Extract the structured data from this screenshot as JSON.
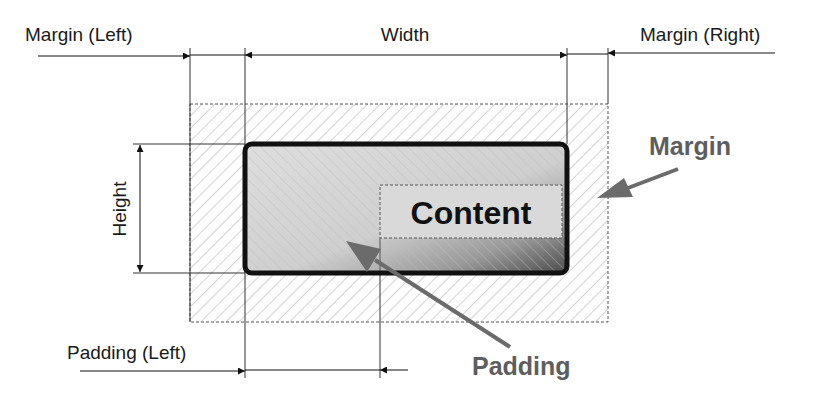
{
  "diagram": {
    "dimension_labels": {
      "margin_left": "Margin (Left)",
      "width": "Width",
      "margin_right": "Margin (Right)",
      "height": "Height",
      "padding_left": "Padding (Left)"
    },
    "callouts": {
      "margin": "Margin",
      "padding": "Padding"
    },
    "boxes": {
      "content": "Content"
    },
    "colors": {
      "border": "#111111",
      "callout_arrow": "#6b6b6b",
      "callout_text": "#5e5e5e",
      "hatch": "#9a9a9a",
      "dashed": "#555555"
    }
  }
}
